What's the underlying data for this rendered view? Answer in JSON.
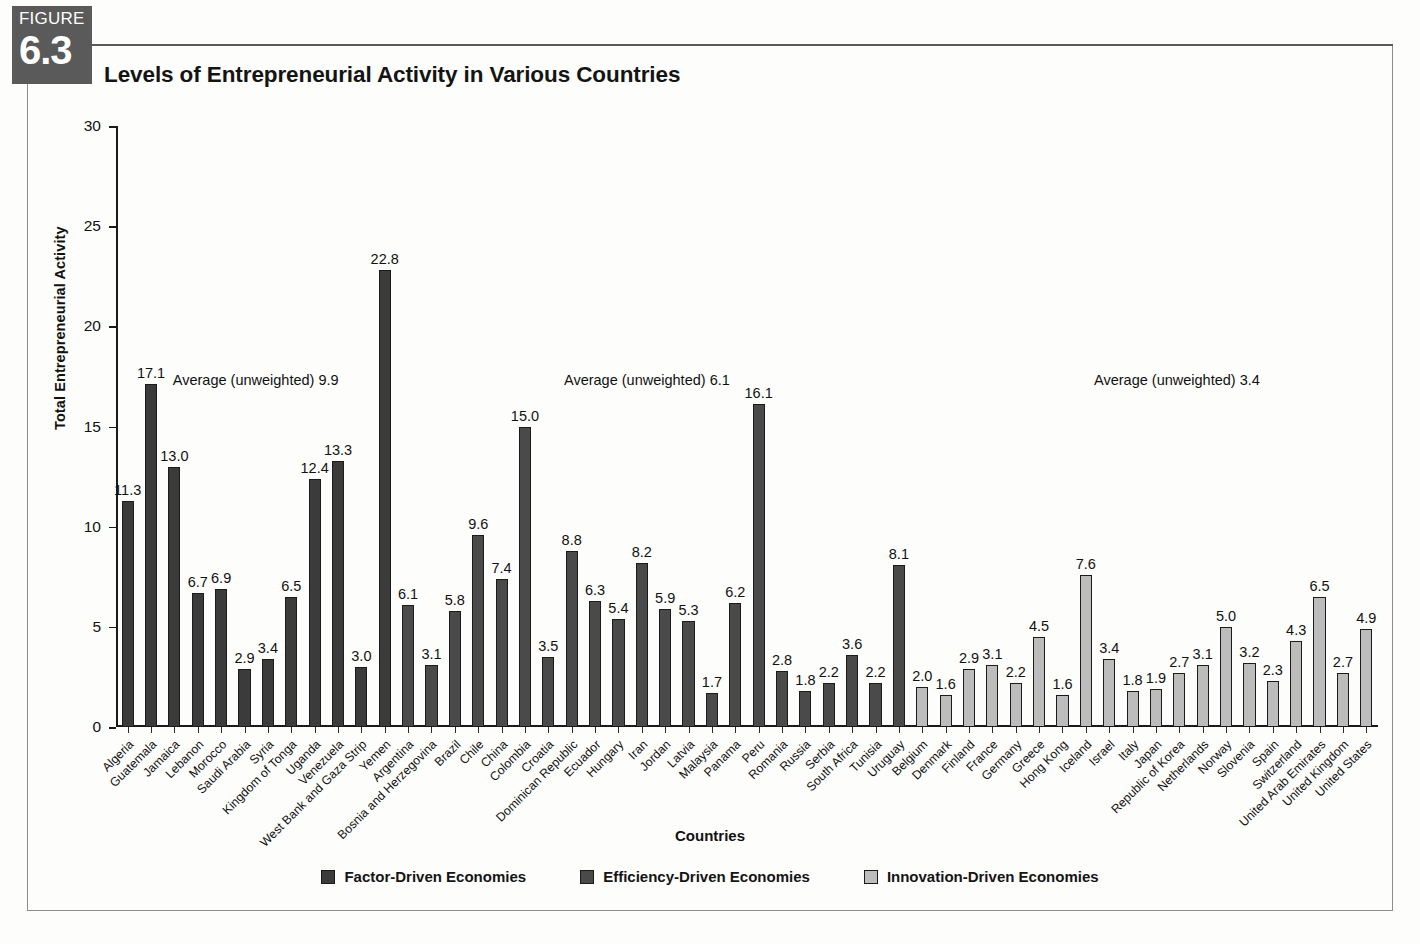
{
  "figure": {
    "tag_word": "FIGURE",
    "number": "6.3",
    "title": "Levels of Entrepreneurial Activity in Various Countries"
  },
  "annotations": [
    {
      "text": "Average (unweighted) 9.9",
      "x_pct": 4.5
    },
    {
      "text": "Average (unweighted) 6.1",
      "x_pct": 35.5
    },
    {
      "text": "Average (unweighted) 3.4",
      "x_pct": 77.5
    }
  ],
  "legend": {
    "position": "bottom-center",
    "items": [
      {
        "label": "Factor-Driven Economies",
        "key": "factor",
        "color": "#3b3b3b"
      },
      {
        "label": "Efficiency-Driven Economies",
        "key": "efficiency",
        "color": "#4a4a4a"
      },
      {
        "label": "Innovation-Driven Economies",
        "key": "innovation",
        "color": "#bcbcbc"
      }
    ]
  },
  "chart_data": {
    "type": "bar",
    "title": "Levels of Entrepreneurial Activity in Various Countries",
    "xlabel": "Countries",
    "ylabel": "Total Entrepreneurial Activity",
    "ylim": [
      0,
      30
    ],
    "yticks": [
      0,
      5,
      10,
      15,
      20,
      25,
      30
    ],
    "grid": false,
    "legend_position": "bottom-center",
    "group_averages": {
      "Factor-Driven Economies": 9.9,
      "Efficiency-Driven Economies": 6.1,
      "Innovation-Driven Economies": 3.4
    },
    "categories": [
      "Algeria",
      "Guatemala",
      "Jamaica",
      "Lebanon",
      "Morocco",
      "Saudi Arabia",
      "Syria",
      "Kingdom of Tonga",
      "Uganda",
      "Venezuela",
      "West Bank and Gaza Strip",
      "Yemen",
      "Argentina",
      "Bosnia and Herzegovina",
      "Brazil",
      "Chile",
      "China",
      "Colombia",
      "Croatia",
      "Dominican Republic",
      "Ecuador",
      "Hungary",
      "Iran",
      "Jordan",
      "Latvia",
      "Malaysia",
      "Panama",
      "Peru",
      "Romania",
      "Russia",
      "Serbia",
      "South Africa",
      "Tunisia",
      "Uruguay",
      "Belgium",
      "Denmark",
      "Finland",
      "France",
      "Germany",
      "Greece",
      "Hong Kong",
      "Iceland",
      "Israel",
      "Italy",
      "Japan",
      "Republic of Korea",
      "Netherlands",
      "Norway",
      "Slovenia",
      "Spain",
      "Switzerland",
      "United Arab Emirates",
      "United Kingdom",
      "United States"
    ],
    "values": [
      11.3,
      17.1,
      13.0,
      6.7,
      6.9,
      2.9,
      3.4,
      6.5,
      12.4,
      13.3,
      3.0,
      22.8,
      6.1,
      3.1,
      5.8,
      9.6,
      7.4,
      15.0,
      3.5,
      8.8,
      6.3,
      5.4,
      8.2,
      5.9,
      5.3,
      1.7,
      6.2,
      16.1,
      2.8,
      1.8,
      2.2,
      3.6,
      2.2,
      8.1,
      2.0,
      1.6,
      2.9,
      3.1,
      2.2,
      4.5,
      1.6,
      7.6,
      3.4,
      1.8,
      1.9,
      2.7,
      3.1,
      5.0,
      3.2,
      2.3,
      4.3,
      6.5,
      2.7,
      4.9
    ],
    "groups": [
      "factor",
      "factor",
      "factor",
      "factor",
      "factor",
      "factor",
      "factor",
      "factor",
      "factor",
      "factor",
      "factor",
      "factor",
      "efficiency",
      "efficiency",
      "efficiency",
      "efficiency",
      "efficiency",
      "efficiency",
      "efficiency",
      "efficiency",
      "efficiency",
      "efficiency",
      "efficiency",
      "efficiency",
      "efficiency",
      "efficiency",
      "efficiency",
      "efficiency",
      "efficiency",
      "efficiency",
      "efficiency",
      "efficiency",
      "efficiency",
      "efficiency",
      "innovation",
      "innovation",
      "innovation",
      "innovation",
      "innovation",
      "innovation",
      "innovation",
      "innovation",
      "innovation",
      "innovation",
      "innovation",
      "innovation",
      "innovation",
      "innovation",
      "innovation",
      "innovation",
      "innovation",
      "innovation",
      "innovation",
      "innovation"
    ]
  }
}
